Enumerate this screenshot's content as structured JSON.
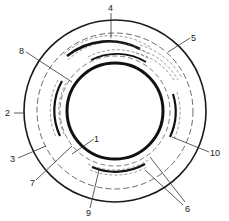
{
  "diagram": {
    "type": "cross-section",
    "center": [
      115,
      111
    ],
    "rings": {
      "outer_solid_r": 91,
      "outer_dashed_r": 78,
      "inner_dashed_r": 55,
      "inner_thick_r": 48
    },
    "colors": {
      "line": "#1a1a1a",
      "dashed": "#444444",
      "background": "#ffffff"
    }
  },
  "labels": [
    {
      "id": "1",
      "text": "1",
      "x": 96,
      "y": 142,
      "tx": 78,
      "ty": 153
    },
    {
      "id": "2",
      "text": "2",
      "x": 8,
      "y": 116,
      "tx": 24,
      "ty": 113
    },
    {
      "id": "3",
      "text": "3",
      "x": 11,
      "y": 161,
      "tx": 46,
      "ty": 145
    },
    {
      "id": "4",
      "text": "4",
      "x": 108,
      "y": 10,
      "tx": 111,
      "ty": 36
    },
    {
      "id": "5",
      "text": "5",
      "x": 192,
      "y": 41,
      "tx": 168,
      "ty": 52
    },
    {
      "id": "6",
      "text": "6",
      "x": 186,
      "y": 209,
      "tx": 152,
      "ty": 158
    },
    {
      "id": "7",
      "text": "7",
      "x": 30,
      "y": 185,
      "tx": 72,
      "ty": 146
    },
    {
      "id": "8",
      "text": "8",
      "x": 19,
      "y": 54,
      "tx": 72,
      "ty": 82
    },
    {
      "id": "9",
      "text": "9",
      "x": 86,
      "y": 215,
      "tx": 99,
      "ty": 171
    },
    {
      "id": "10",
      "text": "10",
      "x": 210,
      "y": 155,
      "tx": 174,
      "ty": 136
    }
  ]
}
